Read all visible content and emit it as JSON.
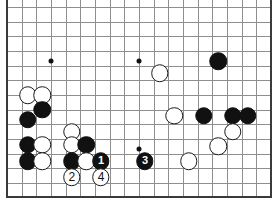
{
  "diagram": {
    "board_size": 19,
    "view": {
      "cols_visible": 18,
      "rows_visible": 13,
      "origin_x": 7,
      "origin_y": 7,
      "spacing": 14.67
    },
    "colors": {
      "background": "#ffffff",
      "grid": "#8e8e8e",
      "border": "#3a3a3a",
      "black_stone": "#111111",
      "white_stone": "#ffffff",
      "white_stone_outline": "#1a1a1a",
      "black_label": "#ffffff",
      "white_label": "#111111"
    },
    "star_points": [
      {
        "col": 3,
        "row": 3.7
      },
      {
        "col": 9,
        "row": 3.7
      },
      {
        "col": 9,
        "row": 9.7
      }
    ],
    "stones": [
      {
        "id": "w-a",
        "color": "white",
        "col": 1.4,
        "row": 6.0,
        "label": ""
      },
      {
        "id": "w-b",
        "color": "white",
        "col": 2.4,
        "row": 6.0,
        "label": ""
      },
      {
        "id": "b-a",
        "color": "black",
        "col": 2.4,
        "row": 7.0,
        "label": ""
      },
      {
        "id": "b-b",
        "color": "black",
        "col": 1.4,
        "row": 7.7,
        "label": ""
      },
      {
        "id": "b-c",
        "color": "black",
        "col": 1.4,
        "row": 9.4,
        "label": ""
      },
      {
        "id": "w-c",
        "color": "white",
        "col": 2.4,
        "row": 9.4,
        "label": ""
      },
      {
        "id": "b-d",
        "color": "black",
        "col": 1.4,
        "row": 10.5,
        "label": ""
      },
      {
        "id": "w-d",
        "color": "white",
        "col": 2.4,
        "row": 10.5,
        "label": ""
      },
      {
        "id": "w-e",
        "color": "white",
        "col": 4.4,
        "row": 8.5,
        "label": ""
      },
      {
        "id": "w-f",
        "color": "white",
        "col": 4.4,
        "row": 9.4,
        "label": ""
      },
      {
        "id": "b-e",
        "color": "black",
        "col": 5.4,
        "row": 9.4,
        "label": ""
      },
      {
        "id": "b-f",
        "color": "black",
        "col": 4.4,
        "row": 10.5,
        "label": ""
      },
      {
        "id": "w-g",
        "color": "white",
        "col": 5.4,
        "row": 10.5,
        "label": ""
      },
      {
        "id": "m-1",
        "color": "black",
        "col": 6.4,
        "row": 10.5,
        "label": "1"
      },
      {
        "id": "m-2",
        "color": "white",
        "col": 4.4,
        "row": 11.6,
        "label": "2"
      },
      {
        "id": "m-4",
        "color": "white",
        "col": 6.4,
        "row": 11.6,
        "label": "4"
      },
      {
        "id": "m-3",
        "color": "black",
        "col": 9.4,
        "row": 10.5,
        "label": "3"
      },
      {
        "id": "w-h",
        "color": "white",
        "col": 10.4,
        "row": 4.5,
        "label": ""
      },
      {
        "id": "b-g",
        "color": "black",
        "col": 14.4,
        "row": 3.7,
        "label": ""
      },
      {
        "id": "w-i",
        "color": "white",
        "col": 11.4,
        "row": 7.4,
        "label": ""
      },
      {
        "id": "b-h",
        "color": "black",
        "col": 13.4,
        "row": 7.4,
        "label": ""
      },
      {
        "id": "b-i",
        "color": "black",
        "col": 15.4,
        "row": 7.4,
        "label": ""
      },
      {
        "id": "b-j",
        "color": "black",
        "col": 16.4,
        "row": 7.4,
        "label": ""
      },
      {
        "id": "w-j",
        "color": "white",
        "col": 15.4,
        "row": 8.5,
        "label": ""
      },
      {
        "id": "w-k",
        "color": "white",
        "col": 14.4,
        "row": 9.5,
        "label": ""
      },
      {
        "id": "w-l",
        "color": "white",
        "col": 12.4,
        "row": 10.5,
        "label": ""
      }
    ],
    "move_sequence": [
      {
        "number": "1",
        "color": "black"
      },
      {
        "number": "2",
        "color": "white"
      },
      {
        "number": "3",
        "color": "black"
      },
      {
        "number": "4",
        "color": "white"
      }
    ]
  }
}
